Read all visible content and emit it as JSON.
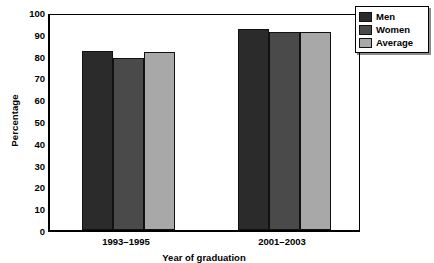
{
  "chart_data": {
    "type": "bar",
    "title": "",
    "xlabel": "Year of graduation",
    "ylabel": "Percentage",
    "categories": [
      "1993–1995",
      "2001–2003"
    ],
    "series": [
      {
        "name": "Men",
        "color": "#2b2b2b",
        "values": [
          82,
          92
        ]
      },
      {
        "name": "Women",
        "color": "#4a4a4a",
        "values": [
          79,
          91
        ]
      },
      {
        "name": "Average",
        "color": "#a8a8a8",
        "values": [
          81.5,
          91
        ]
      }
    ],
    "ylim": [
      0,
      100
    ],
    "ytick_labels": [
      "0",
      "10",
      "20",
      "30",
      "40",
      "50",
      "60",
      "70",
      "80",
      "90",
      "100"
    ],
    "ytick_values": [
      0,
      10,
      20,
      30,
      40,
      50,
      60,
      70,
      80,
      90,
      100
    ],
    "grid": false,
    "legend_position": "top-right",
    "legend_entries": [
      "Men",
      "Women",
      "Average"
    ]
  }
}
